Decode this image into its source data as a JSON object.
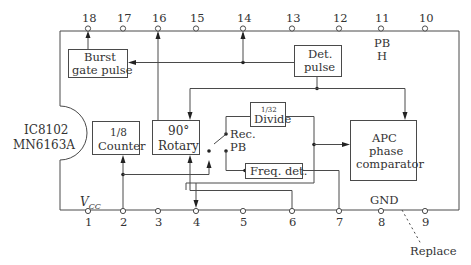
{
  "chip": {
    "ref": "IC8102",
    "part": "MN6163A"
  },
  "pins_top": [
    {
      "num": "18"
    },
    {
      "num": "17"
    },
    {
      "num": "16"
    },
    {
      "num": "15"
    },
    {
      "num": "14"
    },
    {
      "num": "13"
    },
    {
      "num": "12"
    },
    {
      "num": "11"
    },
    {
      "num": "10"
    }
  ],
  "pins_bottom": [
    {
      "num": "1"
    },
    {
      "num": "2"
    },
    {
      "num": "3"
    },
    {
      "num": "4"
    },
    {
      "num": "5"
    },
    {
      "num": "6"
    },
    {
      "num": "7"
    },
    {
      "num": "8"
    },
    {
      "num": "9"
    }
  ],
  "blocks": {
    "burst_gate": {
      "line1": "Burst",
      "line2": "gate pulse"
    },
    "det_pulse": {
      "line1": "Det.",
      "line2": "pulse"
    },
    "counter": {
      "line1": "1/8",
      "line2": "Counter"
    },
    "rotary": {
      "line1": "90°",
      "line2": "Rotary"
    },
    "divide": {
      "line1": "1/32",
      "line2": "Divide"
    },
    "freq_det": {
      "line1": "Freq. det."
    },
    "apc": {
      "line1": "APC",
      "line2": "phase",
      "line3": "comparator"
    }
  },
  "labels": {
    "pb_h_line1": "PB",
    "pb_h_line2": "H",
    "switch_rec": "Rec.",
    "switch_pb": "PB",
    "vcc_main": "V",
    "vcc_sub": "CC",
    "gnd": "GND",
    "replace": "Replace"
  }
}
